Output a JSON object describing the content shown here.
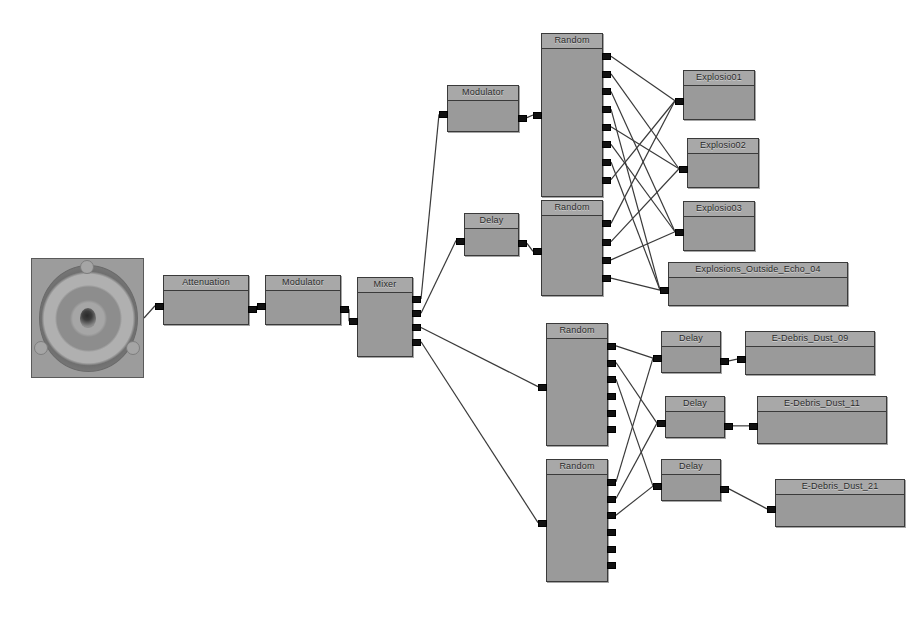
{
  "graph": {
    "background_color": "#ffffff",
    "node_fill": "#9a9a9a",
    "node_header_fill": "#a8a8a8",
    "node_border": "#3a3a3a",
    "port_color": "#111111",
    "wire_color": "#3a3a3a",
    "source": {
      "name": "speaker-source",
      "label": ""
    },
    "nodes": [
      {
        "id": "attenuation",
        "label": "Attenuation",
        "x": 163,
        "y": 275,
        "w": 86,
        "h": 50,
        "inputs": 1,
        "outputs": 1
      },
      {
        "id": "modulator_a",
        "label": "Modulator",
        "x": 265,
        "y": 275,
        "w": 76,
        "h": 50,
        "inputs": 1,
        "outputs": 1
      },
      {
        "id": "mixer",
        "label": "Mixer",
        "x": 357,
        "y": 277,
        "w": 56,
        "h": 80,
        "inputs": 1,
        "outputs": 4
      },
      {
        "id": "modulator_b",
        "label": "Modulator",
        "x": 447,
        "y": 85,
        "w": 72,
        "h": 47,
        "inputs": 1,
        "outputs": 1
      },
      {
        "id": "delay_a",
        "label": "Delay",
        "x": 464,
        "y": 213,
        "w": 55,
        "h": 43,
        "inputs": 1,
        "outputs": 1
      },
      {
        "id": "random_1",
        "label": "Random",
        "x": 541,
        "y": 33,
        "w": 62,
        "h": 164,
        "inputs": 1,
        "outputs": 8
      },
      {
        "id": "random_2",
        "label": "Random",
        "x": 541,
        "y": 200,
        "w": 62,
        "h": 96,
        "inputs": 1,
        "outputs": 4
      },
      {
        "id": "random_3",
        "label": "Random",
        "x": 546,
        "y": 323,
        "w": 62,
        "h": 123,
        "inputs": 1,
        "outputs": 6
      },
      {
        "id": "random_4",
        "label": "Random",
        "x": 546,
        "y": 459,
        "w": 62,
        "h": 123,
        "inputs": 1,
        "outputs": 6
      },
      {
        "id": "explosio01",
        "label": "Explosio01",
        "x": 683,
        "y": 70,
        "w": 72,
        "h": 50,
        "inputs": 1,
        "outputs": 0
      },
      {
        "id": "explosio02",
        "label": "Explosio02",
        "x": 687,
        "y": 138,
        "w": 72,
        "h": 50,
        "inputs": 1,
        "outputs": 0
      },
      {
        "id": "explosio03",
        "label": "Explosio03",
        "x": 683,
        "y": 201,
        "w": 72,
        "h": 50,
        "inputs": 1,
        "outputs": 0
      },
      {
        "id": "explosions_outside_echo_04",
        "label": "Explosions_Outside_Echo_04",
        "x": 668,
        "y": 262,
        "w": 180,
        "h": 44,
        "inputs": 1,
        "outputs": 0
      },
      {
        "id": "delay_b",
        "label": "Delay",
        "x": 661,
        "y": 331,
        "w": 60,
        "h": 42,
        "inputs": 1,
        "outputs": 1
      },
      {
        "id": "delay_c",
        "label": "Delay",
        "x": 665,
        "y": 396,
        "w": 60,
        "h": 42,
        "inputs": 1,
        "outputs": 1
      },
      {
        "id": "delay_d",
        "label": "Delay",
        "x": 661,
        "y": 459,
        "w": 60,
        "h": 42,
        "inputs": 1,
        "outputs": 1
      },
      {
        "id": "e_debris_dust_09",
        "label": "E-Debris_Dust_09",
        "x": 745,
        "y": 331,
        "w": 130,
        "h": 44,
        "inputs": 1,
        "outputs": 0
      },
      {
        "id": "e_debris_dust_11",
        "label": "E-Debris_Dust_11",
        "x": 757,
        "y": 396,
        "w": 130,
        "h": 48,
        "inputs": 1,
        "outputs": 0
      },
      {
        "id": "e_debris_dust_21",
        "label": "E-Debris_Dust_21",
        "x": 775,
        "y": 479,
        "w": 130,
        "h": 48,
        "inputs": 1,
        "outputs": 0
      }
    ],
    "connections": [
      {
        "from": "speaker-source",
        "to": "attenuation"
      },
      {
        "from": "attenuation",
        "to": "modulator_a"
      },
      {
        "from": "modulator_a",
        "to": "mixer"
      },
      {
        "from": "mixer.out1",
        "to": "modulator_b"
      },
      {
        "from": "mixer.out2",
        "to": "delay_a"
      },
      {
        "from": "mixer.out3",
        "to": "random_3"
      },
      {
        "from": "mixer.out4",
        "to": "random_4"
      },
      {
        "from": "modulator_b",
        "to": "random_1"
      },
      {
        "from": "delay_a",
        "to": "random_2"
      },
      {
        "from": "random_1.out1",
        "to": "explosio01"
      },
      {
        "from": "random_1.out2",
        "to": "explosio02"
      },
      {
        "from": "random_1.out3",
        "to": "explosio03"
      },
      {
        "from": "random_1.out4",
        "to": "explosions_outside_echo_04"
      },
      {
        "from": "random_1.out5",
        "to": "explosio02"
      },
      {
        "from": "random_1.out6",
        "to": "explosio03"
      },
      {
        "from": "random_1.out7",
        "to": "explosions_outside_echo_04"
      },
      {
        "from": "random_1.out8",
        "to": "explosio01"
      },
      {
        "from": "random_2.out1",
        "to": "explosio01"
      },
      {
        "from": "random_2.out2",
        "to": "explosio02"
      },
      {
        "from": "random_2.out3",
        "to": "explosio03"
      },
      {
        "from": "random_2.out4",
        "to": "explosions_outside_echo_04"
      },
      {
        "from": "random_3.out1",
        "to": "delay_b"
      },
      {
        "from": "random_3.out2",
        "to": "delay_c"
      },
      {
        "from": "random_3.out3",
        "to": "delay_d"
      },
      {
        "from": "random_4.out1",
        "to": "delay_b"
      },
      {
        "from": "random_4.out2",
        "to": "delay_c"
      },
      {
        "from": "random_4.out3",
        "to": "delay_d"
      },
      {
        "from": "delay_b",
        "to": "e_debris_dust_09"
      },
      {
        "from": "delay_c",
        "to": "e_debris_dust_11"
      },
      {
        "from": "delay_d",
        "to": "e_debris_dust_21"
      }
    ]
  }
}
